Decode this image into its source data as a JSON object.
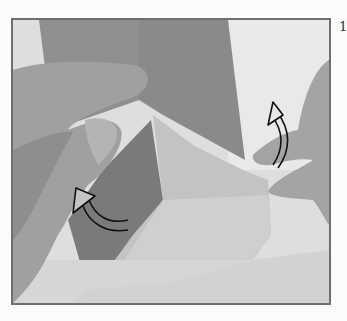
{
  "page": {
    "step_number": "1"
  },
  "photo": {
    "subject": "hands folding grey origami paper",
    "frame_color": "#6f6f6f",
    "colors": {
      "background": "#dcdcdc",
      "paper_dark": "#8a8a8a",
      "paper_mid": "#a3a3a3",
      "paper_light": "#c6c6c6",
      "skin": "#9c9c9c",
      "arrow": "#111111"
    },
    "arrows": [
      {
        "name": "arrow-up-right-fold",
        "direction": "up"
      },
      {
        "name": "arrow-up-left-fold",
        "direction": "up-left"
      }
    ]
  }
}
